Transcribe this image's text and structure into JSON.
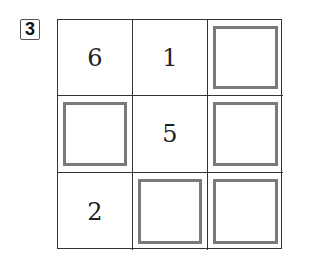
{
  "problem": {
    "number": "3",
    "grid": [
      [
        {
          "value": "6",
          "blank": false
        },
        {
          "value": "1",
          "blank": false
        },
        {
          "value": "",
          "blank": true
        }
      ],
      [
        {
          "value": "",
          "blank": true
        },
        {
          "value": "5",
          "blank": false
        },
        {
          "value": "",
          "blank": true
        }
      ],
      [
        {
          "value": "2",
          "blank": false
        },
        {
          "value": "",
          "blank": true
        },
        {
          "value": "",
          "blank": true
        }
      ]
    ]
  },
  "colors": {
    "grid_line": "#333333",
    "box_border": "#7a7a7a"
  }
}
